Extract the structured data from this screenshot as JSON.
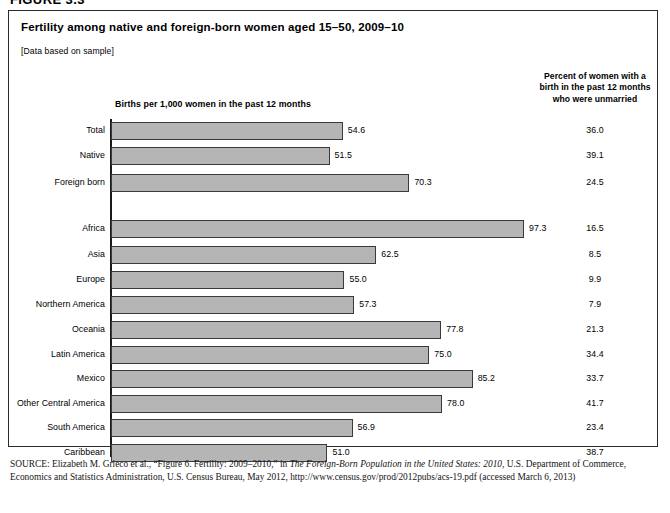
{
  "figure": {
    "caption_label": "FIGURE 3.3"
  },
  "chart_box": {
    "title": "Fertility among native and foreign-born women aged 15–50, 2009–10",
    "data_note": "[Data based on sample]",
    "left_column_header": "Births per 1,000 women in the past 12 months",
    "right_column_header_lines": [
      "Percent of women with a",
      "birth in the past 12 months",
      "who were unmarried"
    ]
  },
  "source": {
    "prefix": "SOURCE:",
    "text_part1": " Elizabeth M. Grieco et al., “Figure 6. Fertility: 2009–2010,” in ",
    "italic_title": "The Foreign-Born Population in the United States: 2010",
    "text_part2": ", U.S. Department of Commerce, Economics and Statistics Administration, U.S. Census Bureau, May 2012, http://www.census.gov/prod/2012pubs/acs-19.pdf (accessed March 6, 2013)"
  },
  "chart_data": {
    "type": "bar",
    "orientation": "horizontal",
    "title": "Fertility among native and foreign-born women aged 15–50, 2009–10",
    "subtitle": "[Data based on sample]",
    "xlabel": "Births per 1,000 women in the past 12 months",
    "ylabel": "",
    "xlim": [
      0,
      100
    ],
    "grid": false,
    "legend": "none",
    "value_columns": [
      "Births per 1,000 women in the past 12 months",
      "Percent of women with a birth in the past 12 months who were unmarried"
    ],
    "groups": [
      {
        "name": "nativity",
        "categories": [
          "Total",
          "Native",
          "Foreign born"
        ],
        "values": [
          54.6,
          51.5,
          70.3
        ],
        "unmarried_percent": [
          36.0,
          39.1,
          24.5
        ]
      },
      {
        "name": "world region of birth",
        "categories": [
          "Africa",
          "Asia",
          "Europe",
          "Northern America",
          "Oceania",
          "Latin America",
          "Mexico",
          "Other Central America",
          "South America",
          "Caribbean"
        ],
        "values": [
          97.3,
          62.5,
          55.0,
          57.3,
          77.8,
          75.0,
          85.2,
          78.0,
          56.9,
          51.0
        ],
        "unmarried_percent": [
          16.5,
          8.5,
          9.9,
          7.9,
          21.3,
          34.4,
          33.7,
          41.7,
          23.4,
          38.7
        ]
      }
    ],
    "categories": [
      "Total",
      "Native",
      "Foreign born",
      "Africa",
      "Asia",
      "Europe",
      "Northern America",
      "Oceania",
      "Latin America",
      "Mexico",
      "Other Central America",
      "South America",
      "Caribbean"
    ],
    "values": [
      54.6,
      51.5,
      70.3,
      97.3,
      62.5,
      55.0,
      57.3,
      77.8,
      75.0,
      85.2,
      78.0,
      56.9,
      51.0
    ],
    "series": [
      {
        "name": "Births per 1,000 women in the past 12 months",
        "values": [
          54.6,
          51.5,
          70.3,
          97.3,
          62.5,
          55.0,
          57.3,
          77.8,
          75.0,
          85.2,
          78.0,
          56.9,
          51.0
        ]
      },
      {
        "name": "Percent of women with a birth in the past 12 months who were unmarried",
        "values": [
          36.0,
          39.1,
          24.5,
          16.5,
          8.5,
          9.9,
          7.9,
          21.3,
          34.4,
          33.7,
          41.7,
          23.4,
          38.7
        ]
      }
    ],
    "bar_color": "#b5b5b5",
    "bar_border_color": "#3a3a3a"
  },
  "rows": [
    {
      "label": "Total",
      "value": "54.6",
      "value_num": 54.6,
      "pct": "36.0",
      "top": 116
    },
    {
      "label": "Native",
      "value": "51.5",
      "value_num": 51.5,
      "pct": "39.1",
      "top": 141
    },
    {
      "label": "Foreign born",
      "value": "70.3",
      "value_num": 70.3,
      "pct": "24.5",
      "top": 168
    },
    {
      "label": "Africa",
      "value": "97.3",
      "value_num": 97.3,
      "pct": "16.5",
      "top": 214
    },
    {
      "label": "Asia",
      "value": "62.5",
      "value_num": 62.5,
      "pct": "8.5",
      "top": 240
    },
    {
      "label": "Europe",
      "value": "55.0",
      "value_num": 55.0,
      "pct": "9.9",
      "top": 265
    },
    {
      "label": "Northern America",
      "value": "57.3",
      "value_num": 57.3,
      "pct": "7.9",
      "top": 290
    },
    {
      "label": "Oceania",
      "value": "77.8",
      "value_num": 77.8,
      "pct": "21.3",
      "top": 315
    },
    {
      "label": "Latin America",
      "value": "75.0",
      "value_num": 75.0,
      "pct": "34.4",
      "top": 340
    },
    {
      "label": "Mexico",
      "value": "85.2",
      "value_num": 85.2,
      "pct": "33.7",
      "top": 364
    },
    {
      "label": "Other Central America",
      "value": "78.0",
      "value_num": 78.0,
      "pct": "41.7",
      "top": 389
    },
    {
      "label": "South America",
      "value": "56.9",
      "value_num": 56.9,
      "pct": "23.4",
      "top": 413
    },
    {
      "label": "Caribbean",
      "value": "51.0",
      "value_num": 51.0,
      "pct": "38.7",
      "top": 438
    }
  ]
}
